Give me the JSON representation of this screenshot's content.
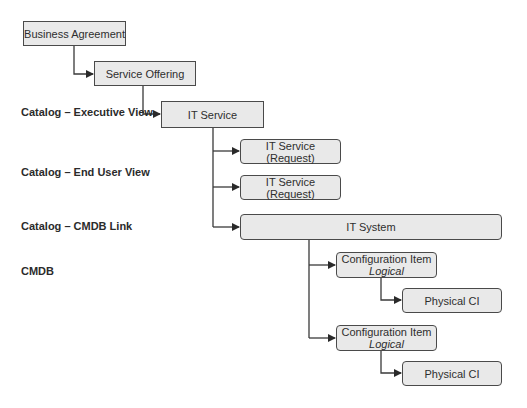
{
  "diagram": {
    "labels": [
      {
        "id": "executive-view",
        "text": "Catalog – Executive View"
      },
      {
        "id": "end-user-view",
        "text": "Catalog – End User View"
      },
      {
        "id": "cmdb-link",
        "text": "Catalog – CMDB Link"
      },
      {
        "id": "cmdb",
        "text": "CMDB"
      }
    ],
    "nodes": {
      "business_agreement": {
        "title": "Business Agreement"
      },
      "service_offering": {
        "title": "Service Offering"
      },
      "it_service": {
        "title": "IT Service"
      },
      "it_service_request_1": {
        "title": "IT Service (Request)"
      },
      "it_service_request_2": {
        "title": "IT Service (Request)"
      },
      "it_system": {
        "title": "IT System"
      },
      "config_item_1": {
        "title": "Configuration Item",
        "subtitle": "Logical"
      },
      "physical_ci_1": {
        "title": "Physical CI"
      },
      "config_item_2": {
        "title": "Configuration Item",
        "subtitle": "Logical"
      },
      "physical_ci_2": {
        "title": "Physical CI"
      }
    },
    "colors": {
      "box_fill": "#e9e9e9",
      "box_border": "#4a4a4a",
      "connector": "#3a3a3a"
    }
  }
}
